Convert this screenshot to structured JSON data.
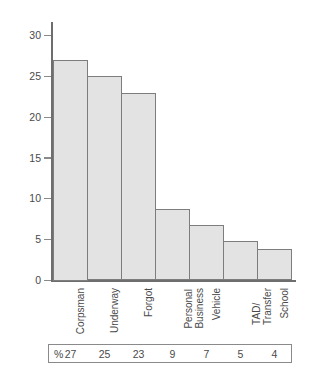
{
  "chart_data": {
    "type": "bar",
    "title": "",
    "subtitle": "",
    "xlabel": "",
    "ylabel": "",
    "ylim": [
      0,
      30
    ],
    "grid": false,
    "legend": "none",
    "categories": [
      "Corpsman",
      "Underway",
      "Forgot",
      "Personal Business",
      "Vehicle",
      "TAD/ Transfer",
      "School"
    ],
    "category_lines": [
      [
        "Corpsman"
      ],
      [
        "Underway"
      ],
      [
        "Forgot"
      ],
      [
        "Personal",
        "Business"
      ],
      [
        "Vehicle"
      ],
      [
        "TAD/",
        "Transfer"
      ],
      [
        "School"
      ]
    ],
    "values": [
      27,
      25,
      23,
      9,
      7,
      5,
      4
    ],
    "bar_heights": [
      27,
      25,
      23,
      8.8,
      6.8,
      4.8,
      3.8
    ],
    "y_ticks": [
      0,
      5,
      10,
      15,
      20,
      25,
      30
    ],
    "y_tick_labels": [
      "0",
      "5",
      "10",
      "15",
      "20",
      "25",
      "30"
    ],
    "value_row": {
      "unit_symbol": "%",
      "values": [
        "27",
        "25",
        "23",
        "9",
        "7",
        "5",
        "4"
      ]
    },
    "colors": {
      "bar_fill": "#e3e3e3",
      "bar_stroke": "#7d7d7d",
      "axis": "#6e6e6e",
      "text": "#4a4a4a",
      "table_border": "#8a8a8a",
      "background": "#ffffff"
    }
  }
}
